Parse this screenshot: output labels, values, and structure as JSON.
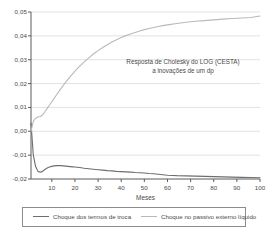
{
  "chart_data": {
    "type": "line",
    "title": "",
    "annotation_lines": [
      "Resposta de Cholesky do LOG (CESTA)",
      "a inovações de um dp"
    ],
    "xlabel": "Meses",
    "ylabel": "",
    "xlim": [
      1,
      100
    ],
    "ylim": [
      -0.02,
      0.05
    ],
    "grid": true,
    "grid_orientation": "horizontal",
    "legend_position": "bottom",
    "xticks": [
      10,
      20,
      30,
      40,
      50,
      60,
      70,
      80,
      90,
      100
    ],
    "xtick_labels": [
      "10",
      "20",
      "30",
      "40",
      "50",
      "60",
      "70",
      "80",
      "90",
      "100"
    ],
    "yticks": [
      0.05,
      0.04,
      0.03,
      0.02,
      0.01,
      0.0,
      -0.01,
      -0.02
    ],
    "ytick_labels": [
      "0,05",
      "0,04",
      "0,03",
      "0,02",
      "0,01",
      "0,00",
      "-0,01",
      "-0,02"
    ],
    "colors": {
      "series_terms_of_trade": "#6e6e6e",
      "series_external_liabilities": "#b9b9b9",
      "axis": "#5a5a5a",
      "grid": "#e2e2e2",
      "text": "#4a4a4a"
    },
    "series": [
      {
        "name": "Choque dos termos de troca",
        "color": "#6e6e6e",
        "x": [
          1,
          2,
          3,
          4,
          5,
          6,
          7,
          8,
          9,
          10,
          11,
          12,
          13,
          14,
          15,
          16,
          17,
          18,
          19,
          20,
          22,
          24,
          26,
          28,
          30,
          32,
          34,
          36,
          38,
          40,
          42,
          44,
          46,
          48,
          50,
          52,
          54,
          56,
          58,
          60,
          64,
          68,
          72,
          76,
          80,
          84,
          88,
          92,
          96,
          100
        ],
        "values": [
          0.0035,
          -0.01,
          -0.0148,
          -0.0168,
          -0.0172,
          -0.0168,
          -0.016,
          -0.0154,
          -0.015,
          -0.0147,
          -0.0145,
          -0.0144,
          -0.0144,
          -0.0144,
          -0.0145,
          -0.0146,
          -0.0147,
          -0.0148,
          -0.0149,
          -0.015,
          -0.0152,
          -0.0155,
          -0.0157,
          -0.0159,
          -0.0161,
          -0.0163,
          -0.0165,
          -0.0166,
          -0.0168,
          -0.0169,
          -0.017,
          -0.0171,
          -0.0173,
          -0.0174,
          -0.0175,
          -0.0177,
          -0.0178,
          -0.018,
          -0.0182,
          -0.0184,
          -0.0186,
          -0.0187,
          -0.0188,
          -0.0189,
          -0.019,
          -0.0191,
          -0.0192,
          -0.0193,
          -0.0194,
          -0.0195
        ]
      },
      {
        "name": "Choque no passivo externo líquido",
        "color": "#b9b9b9",
        "x": [
          1,
          2,
          3,
          4,
          5,
          6,
          7,
          8,
          9,
          10,
          11,
          12,
          13,
          14,
          15,
          16,
          17,
          18,
          19,
          20,
          22,
          24,
          26,
          28,
          30,
          32,
          34,
          36,
          38,
          40,
          42,
          44,
          46,
          48,
          50,
          52,
          54,
          56,
          58,
          60,
          64,
          68,
          72,
          76,
          80,
          84,
          88,
          92,
          96,
          100
        ],
        "values": [
          0.0,
          0.0042,
          0.0055,
          0.006,
          0.0062,
          0.0068,
          0.0082,
          0.0096,
          0.011,
          0.0124,
          0.0138,
          0.0152,
          0.0166,
          0.018,
          0.0193,
          0.0206,
          0.0218,
          0.023,
          0.0241,
          0.0252,
          0.0272,
          0.0291,
          0.0308,
          0.0324,
          0.0338,
          0.0351,
          0.0363,
          0.0374,
          0.0384,
          0.0393,
          0.0401,
          0.0408,
          0.0414,
          0.042,
          0.0426,
          0.0431,
          0.0435,
          0.0439,
          0.0443,
          0.0446,
          0.0452,
          0.0457,
          0.0461,
          0.0464,
          0.0467,
          0.047,
          0.0473,
          0.0475,
          0.0477,
          0.0483
        ]
      }
    ]
  },
  "legend": {
    "entries": [
      {
        "label": "Choque dos termos de troca"
      },
      {
        "label": "Choque no passivo externo líquido"
      }
    ]
  }
}
